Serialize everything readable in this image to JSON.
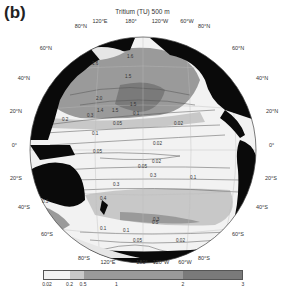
{
  "panel_label": "(b)",
  "title": "Tritium (TU) 500 m",
  "map": {
    "projection": "orthographic (Pacific-centred)",
    "top_lon_labels": [
      "120°E",
      "180°",
      "120°W",
      "60°W"
    ],
    "bottom_lon_labels": [
      "120°E",
      "180°",
      "120°W",
      "60°W"
    ],
    "left_lat_labels": [
      "80°N",
      "60°N",
      "40°N",
      "20°N",
      "0°",
      "20°S",
      "40°S",
      "60°S",
      "80°S"
    ],
    "right_lat_labels": [
      "80°N",
      "60°N",
      "40°N",
      "20°N",
      "0°",
      "20°S",
      "40°S",
      "60°S",
      "80°S"
    ],
    "contour_labels": [
      "1.6",
      "1.6",
      "1.5",
      "2.0",
      "1.5",
      "1.5",
      "1.4",
      "0.3",
      "0.2",
      "0.1",
      "0.05",
      "0.02",
      "0.1",
      "0.02",
      "0.05",
      "0.02",
      "0.05",
      "0.1",
      "0.3",
      "0.3",
      "0.4",
      "0.3",
      "0.5",
      "0.3",
      "0.1",
      "0.1",
      "0.05",
      "0.02"
    ]
  },
  "colorbar": {
    "ticks": [
      "0.02",
      "0.2",
      "0.5",
      "1",
      "2",
      "3"
    ],
    "bins": [
      {
        "from": 0,
        "to": 0.2,
        "color": "#f2f2f2"
      },
      {
        "from": 0.2,
        "to": 0.5,
        "color": "#c8c8c8"
      },
      {
        "from": 0.5,
        "to": 2,
        "color": "#9a9a9a"
      },
      {
        "from": 2,
        "to": 3,
        "color": "#7a7a7a"
      }
    ]
  },
  "colors": {
    "land": "#0a0a0a",
    "low": "#f2f2f2",
    "mid_low": "#c8c8c8",
    "mid": "#9a9a9a",
    "high": "#7a7a7a"
  }
}
